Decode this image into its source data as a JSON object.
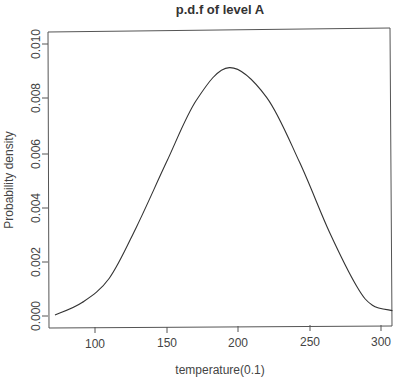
{
  "chart_data": {
    "type": "line",
    "title": "p.d.f of level A",
    "xlabel": "temperature(0.1)",
    "ylabel": "Probability density",
    "xlim": [
      70,
      308
    ],
    "ylim": [
      0,
      0.0103
    ],
    "grid": false,
    "legend": null,
    "x_ticks": [
      "100",
      "150",
      "200",
      "250",
      "300"
    ],
    "y_ticks": [
      "0.000",
      "0.002",
      "0.004",
      "0.006",
      "0.008",
      "0.010"
    ],
    "series": [
      {
        "name": "density",
        "color": "#333333",
        "x": [
          72,
          91,
          110,
          129,
          150,
          171,
          194,
          220,
          243,
          264,
          283,
          294,
          308
        ],
        "y": [
          4e-05,
          0.0005,
          0.0014,
          0.0033,
          0.0057,
          0.008,
          0.0092,
          0.0081,
          0.0057,
          0.0031,
          0.0011,
          0.0004,
          0.0002
        ]
      }
    ]
  }
}
